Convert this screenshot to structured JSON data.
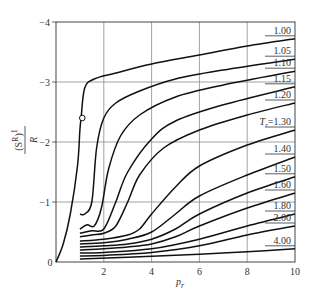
{
  "chart_data": {
    "type": "line",
    "title": "",
    "xlabel": "p_r",
    "ylabel": "(S^R)^1 / R",
    "xlim": [
      0,
      10
    ],
    "ylim": [
      0,
      -4
    ],
    "y_axis_inverted": true,
    "grid": true,
    "x_ticks": [
      "0",
      "2",
      "4",
      "6",
      "8",
      "10"
    ],
    "y_ticks": [
      "0",
      "−1",
      "−2",
      "−3",
      "−4"
    ],
    "legend_position": "inline labels at right edge",
    "series": [
      {
        "name": "1.00",
        "x": [
          0,
          0.3,
          0.6,
          0.9,
          1.0,
          1.05,
          1.2,
          1.6,
          2.5,
          4,
          6,
          8,
          10
        ],
        "y": [
          0,
          -0.3,
          -0.8,
          -1.6,
          -2.2,
          -2.4,
          -2.9,
          -3.05,
          -3.15,
          -3.3,
          -3.45,
          -3.6,
          -3.72
        ]
      },
      {
        "name": "1.05",
        "x": [
          1.0,
          1.2,
          1.5,
          1.7,
          2.0,
          2.5,
          3.5,
          5,
          7,
          10
        ],
        "y": [
          -0.8,
          -0.8,
          -1.0,
          -1.9,
          -2.4,
          -2.65,
          -2.85,
          -3.05,
          -3.2,
          -3.38
        ]
      },
      {
        "name": "1.10",
        "x": [
          1.0,
          1.3,
          1.6,
          1.9,
          2.2,
          2.7,
          3.5,
          5,
          7,
          10
        ],
        "y": [
          -0.55,
          -0.62,
          -0.6,
          -0.9,
          -1.55,
          -2.1,
          -2.45,
          -2.75,
          -2.95,
          -3.18
        ]
      },
      {
        "name": "1.15",
        "x": [
          1.0,
          1.5,
          2.0,
          2.5,
          3.0,
          4,
          5,
          7,
          10
        ],
        "y": [
          -0.48,
          -0.52,
          -0.55,
          -1.0,
          -1.5,
          -2.05,
          -2.35,
          -2.62,
          -2.92
        ]
      },
      {
        "name": "1.20",
        "x": [
          1.0,
          1.5,
          2.0,
          2.5,
          3.0,
          3.5,
          4.5,
          6,
          8,
          10
        ],
        "y": [
          -0.42,
          -0.45,
          -0.48,
          -0.6,
          -1.0,
          -1.45,
          -1.9,
          -2.2,
          -2.45,
          -2.65
        ]
      },
      {
        "name": "T_r=1.30",
        "x": [
          1.0,
          2.0,
          3.0,
          3.5,
          4,
          5,
          6,
          8,
          10
        ],
        "y": [
          -0.35,
          -0.38,
          -0.45,
          -0.55,
          -0.8,
          -1.25,
          -1.6,
          -1.95,
          -2.2
        ]
      },
      {
        "name": "1.40",
        "x": [
          1.0,
          2.0,
          3.0,
          4,
          5,
          6,
          8,
          10
        ],
        "y": [
          -0.3,
          -0.32,
          -0.38,
          -0.5,
          -0.8,
          -1.1,
          -1.45,
          -1.75
        ]
      },
      {
        "name": "1.50",
        "x": [
          1.0,
          2.0,
          3.0,
          4,
          5,
          6,
          8,
          10
        ],
        "y": [
          -0.25,
          -0.27,
          -0.3,
          -0.38,
          -0.55,
          -0.8,
          -1.15,
          -1.42
        ]
      },
      {
        "name": "1.60",
        "x": [
          1.0,
          2.0,
          3.0,
          4,
          5,
          6,
          8,
          10
        ],
        "y": [
          -0.2,
          -0.22,
          -0.25,
          -0.3,
          -0.42,
          -0.6,
          -0.9,
          -1.15
        ]
      },
      {
        "name": "1.80",
        "x": [
          1.0,
          2.0,
          4,
          6,
          8,
          10
        ],
        "y": [
          -0.15,
          -0.16,
          -0.22,
          -0.38,
          -0.6,
          -0.8
        ]
      },
      {
        "name": "2.00",
        "x": [
          1.0,
          2.0,
          4,
          6,
          8,
          10
        ],
        "y": [
          -0.1,
          -0.11,
          -0.16,
          -0.27,
          -0.45,
          -0.6
        ]
      },
      {
        "name": "4.00",
        "x": [
          1.0,
          3,
          6,
          8,
          10
        ],
        "y": [
          -0.05,
          -0.08,
          -0.13,
          -0.17,
          -0.22
        ]
      }
    ],
    "annotations": [
      {
        "type": "open-circle-marker",
        "x": 1.1,
        "y": -2.4,
        "series": "1.00"
      }
    ]
  },
  "labels": {
    "xlabel": "p",
    "xlabel_sub": "r",
    "ylabel_num": "(S",
    "ylabel_sup": "R",
    "ylabel_close": ")",
    "ylabel_exp": "1",
    "ylabel_den": "R"
  }
}
